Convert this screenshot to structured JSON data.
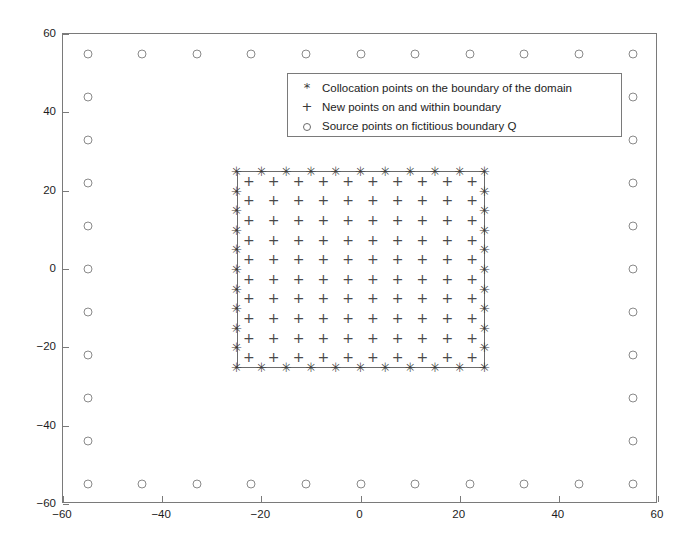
{
  "figure": {
    "title": "",
    "background": "#ffffff"
  },
  "legend": {
    "position": "upper-center",
    "entries": [
      {
        "marker": "asterisk-icon",
        "symbol": "*",
        "label": "Collocation points on the boundary of the domain"
      },
      {
        "marker": "plus-icon",
        "symbol": "+",
        "label": "New points on and within boundary"
      },
      {
        "marker": "circle-icon",
        "symbol": "o",
        "label": "Source points on fictitious boundary Q"
      }
    ]
  },
  "axes": {
    "xlabel": "",
    "ylabel": "",
    "xlim": [
      -60,
      60
    ],
    "ylim": [
      -60,
      60
    ],
    "xticks": [
      -60,
      -40,
      -20,
      0,
      20,
      40,
      60
    ],
    "yticks": [
      -60,
      -40,
      -20,
      0,
      20,
      40,
      60
    ],
    "xticklabels": [
      "-60",
      "-40",
      "-20",
      "0",
      "20",
      "40",
      "60"
    ],
    "yticklabels": [
      "-60",
      "-40",
      "-20",
      "0",
      "20",
      "40",
      "60"
    ],
    "grid": false,
    "box": true
  },
  "chart_data": {
    "type": "scatter",
    "title": "",
    "xlabel": "",
    "ylabel": "",
    "xlim": [
      -60,
      60
    ],
    "ylim": [
      -60,
      60
    ],
    "grid": false,
    "legend_position": "upper-center",
    "series": [
      {
        "name": "Collocation points on the boundary of the domain",
        "marker": "*",
        "color": "#3a3a3a",
        "description": "Perimeter of square domain, half-width 25, 11 nodes per side (corners shared), 40 distinct points.",
        "geometry": {
          "shape": "square-perimeter",
          "half_width": 25,
          "nodes_per_side": 11,
          "spacing": 5
        },
        "x": [
          -25,
          -20,
          -15,
          -10,
          -5,
          0,
          5,
          10,
          15,
          20,
          25,
          -25,
          25,
          -25,
          25,
          -25,
          25,
          -25,
          25,
          -25,
          25,
          -25,
          25,
          -25,
          25,
          -25,
          25,
          -25,
          25,
          -25,
          -20,
          -15,
          -10,
          -5,
          0,
          5,
          10,
          15,
          20,
          25
        ],
        "y": [
          25,
          25,
          25,
          25,
          25,
          25,
          25,
          25,
          25,
          25,
          25,
          20,
          20,
          15,
          15,
          10,
          10,
          5,
          5,
          0,
          0,
          -5,
          -5,
          -10,
          -10,
          -15,
          -15,
          -20,
          -20,
          -25,
          -25,
          -25,
          -25,
          -25,
          -25,
          -25,
          -25,
          -25,
          -25,
          -25
        ]
      },
      {
        "name": "New points on and within boundary",
        "marker": "+",
        "color": "#4a4a4a",
        "description": "Interior grid of 10 x 10 points offset half a cell inside the domain boundary.",
        "geometry": {
          "shape": "interior-grid",
          "rows": 10,
          "cols": 10,
          "x_start": -22.5,
          "x_end": 22.5,
          "y_start": -22.5,
          "y_end": 22.5,
          "spacing": 5
        }
      },
      {
        "name": "Source points on fictitious boundary Q",
        "marker": "o",
        "color": "#8a8a8a",
        "description": "Perimeter of fictitious square, half-width 55, 11 nodes per side, 40 distinct points.",
        "geometry": {
          "shape": "square-perimeter",
          "half_width": 55,
          "nodes_per_side": 11,
          "spacing": 11
        },
        "x": [
          -55,
          -44,
          -33,
          -22,
          -11,
          0,
          11,
          22,
          33,
          44,
          55,
          -55,
          55,
          -55,
          55,
          -55,
          55,
          -55,
          55,
          -55,
          55,
          -55,
          55,
          -55,
          55,
          -55,
          55,
          -55,
          55,
          -55,
          -44,
          -33,
          -22,
          -11,
          0,
          11,
          22,
          33,
          44,
          55
        ],
        "y": [
          55,
          55,
          55,
          55,
          55,
          55,
          55,
          55,
          55,
          55,
          55,
          44,
          44,
          33,
          33,
          22,
          22,
          11,
          11,
          0,
          0,
          -11,
          -11,
          -22,
          -22,
          -33,
          -33,
          -44,
          -44,
          -55,
          -55,
          -55,
          -55,
          -55,
          -55,
          -55,
          -55,
          -55,
          -55,
          -55
        ]
      }
    ]
  }
}
